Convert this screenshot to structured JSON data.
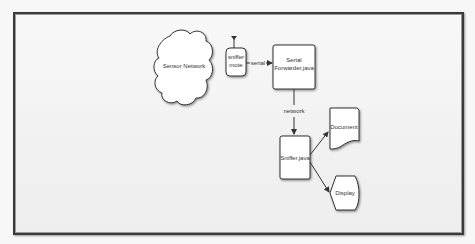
{
  "diagram": {
    "nodes": {
      "sensor_network": "Sensor Network",
      "sniffer_mote_line1": "sniffer",
      "sniffer_mote_line2": "mote",
      "serial_forwarder_line1": "Serial",
      "serial_forwarder_line2": "Forwarder.java",
      "sniffer_java": "Sniffer.java",
      "document": "Document",
      "display": "Display"
    },
    "edges": {
      "serial": "serial",
      "network": "network"
    }
  }
}
